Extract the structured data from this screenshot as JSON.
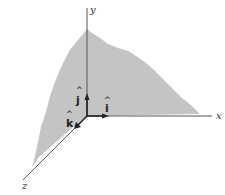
{
  "diagram": {
    "axes": [
      {
        "name": "x",
        "label": "x"
      },
      {
        "name": "y",
        "label": "y"
      },
      {
        "name": "z",
        "label": "z"
      }
    ],
    "unit_vectors": [
      {
        "name": "i",
        "label": "i",
        "hat": "^",
        "axis": "x"
      },
      {
        "name": "j",
        "label": "j",
        "hat": "^",
        "axis": "y"
      },
      {
        "name": "k",
        "label": "k",
        "hat": "^",
        "axis": "z"
      }
    ],
    "colors": {
      "plane_fill": "#c4c4c4",
      "axis_line": "#555555",
      "vector": "#222222",
      "background": "#ffffff"
    }
  }
}
